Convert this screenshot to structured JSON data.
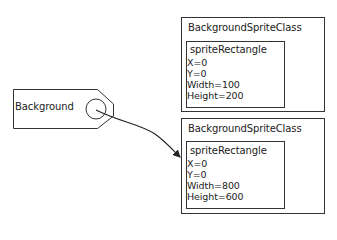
{
  "diagram": {
    "tag": {
      "label": "Background"
    },
    "boxes": [
      {
        "title": "BackgroundSpriteClass",
        "inner": {
          "title": "spriteRectangle",
          "props": [
            "X=0",
            "Y=0",
            "Width=100",
            "Height=200"
          ]
        }
      },
      {
        "title": "BackgroundSpriteClass",
        "inner": {
          "title": "spriteRectangle",
          "props": [
            "X=0",
            "Y=0",
            "Width=800",
            "Height=600"
          ]
        }
      }
    ],
    "arrow": {
      "from": "Background",
      "to": "boxes.1"
    },
    "colors": {
      "line": "#333333",
      "background": "#ffffff"
    }
  }
}
